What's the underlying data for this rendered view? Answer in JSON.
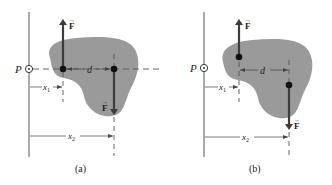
{
  "figure": {
    "panels": [
      {
        "id": "a",
        "caption": "(a)",
        "point_label": "P",
        "force_label": "F",
        "force_vector_mark": "→",
        "dim_d": "d",
        "dim_x1": "x",
        "dim_x1_sub": "1",
        "dim_x2": "x",
        "dim_x2_sub": "2"
      },
      {
        "id": "b",
        "caption": "(b)",
        "point_label": "P",
        "force_label": "F",
        "force_vector_mark": "→",
        "dim_d": "d",
        "dim_x1": "x",
        "dim_x1_sub": "1",
        "dim_x2": "x",
        "dim_x2_sub": "2"
      }
    ],
    "colors": {
      "body_fill": "#9a9a9a",
      "arrow": "#3c3c3c",
      "line": "#555555",
      "dot": "#111111"
    }
  }
}
